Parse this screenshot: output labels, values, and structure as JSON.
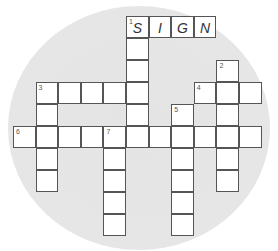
{
  "puzzle": {
    "type": "crossword",
    "cell_size": 22.6,
    "origin": {
      "x": 13,
      "y": 16
    },
    "row_height": 22,
    "cells": [
      {
        "c": 5,
        "r": 0,
        "num": "1",
        "letter": "S"
      },
      {
        "c": 6,
        "r": 0,
        "letter": "I"
      },
      {
        "c": 7,
        "r": 0,
        "letter": "G"
      },
      {
        "c": 8,
        "r": 0,
        "letter": "N"
      },
      {
        "c": 5,
        "r": 1
      },
      {
        "c": 5,
        "r": 2
      },
      {
        "c": 9,
        "r": 2,
        "num": "2"
      },
      {
        "c": 1,
        "r": 3,
        "num": "3"
      },
      {
        "c": 2,
        "r": 3
      },
      {
        "c": 3,
        "r": 3
      },
      {
        "c": 4,
        "r": 3
      },
      {
        "c": 5,
        "r": 3
      },
      {
        "c": 8,
        "r": 3,
        "num": "4"
      },
      {
        "c": 9,
        "r": 3
      },
      {
        "c": 10,
        "r": 3
      },
      {
        "c": 1,
        "r": 4
      },
      {
        "c": 5,
        "r": 4
      },
      {
        "c": 7,
        "r": 4,
        "num": "5"
      },
      {
        "c": 9,
        "r": 4
      },
      {
        "c": 0,
        "r": 5,
        "num": "6"
      },
      {
        "c": 1,
        "r": 5
      },
      {
        "c": 2,
        "r": 5
      },
      {
        "c": 3,
        "r": 5
      },
      {
        "c": 4,
        "r": 5,
        "num": "7"
      },
      {
        "c": 5,
        "r": 5
      },
      {
        "c": 6,
        "r": 5
      },
      {
        "c": 7,
        "r": 5
      },
      {
        "c": 8,
        "r": 5
      },
      {
        "c": 9,
        "r": 5
      },
      {
        "c": 10,
        "r": 5
      },
      {
        "c": 1,
        "r": 6
      },
      {
        "c": 4,
        "r": 6
      },
      {
        "c": 7,
        "r": 6
      },
      {
        "c": 9,
        "r": 6
      },
      {
        "c": 1,
        "r": 7
      },
      {
        "c": 4,
        "r": 7
      },
      {
        "c": 7,
        "r": 7
      },
      {
        "c": 9,
        "r": 7
      },
      {
        "c": 4,
        "r": 8
      },
      {
        "c": 7,
        "r": 8
      },
      {
        "c": 4,
        "r": 9
      },
      {
        "c": 7,
        "r": 9
      }
    ],
    "entries": {
      "across": [
        {
          "num": "1",
          "answer": "SIGN",
          "length": 4
        },
        {
          "num": "3",
          "length": 5
        },
        {
          "num": "4",
          "length": 3
        },
        {
          "num": "6",
          "length": 11
        }
      ],
      "down": [
        {
          "num": "1",
          "length": 6
        },
        {
          "num": "2",
          "length": 6
        },
        {
          "num": "3",
          "length": 5
        },
        {
          "num": "5",
          "length": 6
        },
        {
          "num": "7",
          "length": 5
        }
      ]
    }
  },
  "colors": {
    "background_blob": "#e6e6e6",
    "cell_fill": "#ffffff",
    "cell_border": "#555555"
  }
}
